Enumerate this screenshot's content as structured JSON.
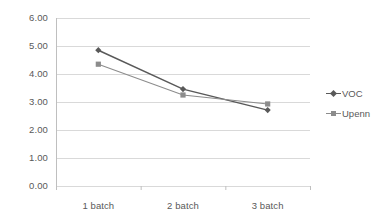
{
  "chart_data": {
    "type": "line",
    "title": "",
    "xlabel": "",
    "ylabel": "",
    "categories": [
      "1 batch",
      "2 batch",
      "3 batch"
    ],
    "ylim": [
      0.0,
      6.0
    ],
    "y_ticks": [
      0.0,
      1.0,
      2.0,
      3.0,
      4.0,
      5.0,
      6.0
    ],
    "y_tick_labels": [
      "0.00",
      "1.00",
      "2.00",
      "3.00",
      "4.00",
      "5.00",
      "6.00"
    ],
    "grid": true,
    "grid_axis": "y",
    "legend_position": "right",
    "series": [
      {
        "name": "VOC",
        "values": [
          4.85,
          3.46,
          2.71
        ],
        "marker": "diamond",
        "color": "#595959"
      },
      {
        "name": "Upenn",
        "values": [
          4.35,
          3.25,
          2.93
        ],
        "marker": "square",
        "color": "#8c8c8c"
      }
    ]
  },
  "legend": {
    "items": [
      {
        "label": "VOC",
        "marker_icon": "diamond-marker-icon"
      },
      {
        "label": "Upenn",
        "marker_icon": "square-marker-icon"
      }
    ]
  },
  "axes": {
    "y_labels": [
      "6.00",
      "5.00",
      "4.00",
      "3.00",
      "2.00",
      "1.00",
      "0.00"
    ],
    "x_labels": [
      "1 batch",
      "2 batch",
      "3 batch"
    ]
  },
  "colors": {
    "series_voc": "#595959",
    "series_upenn": "#8c8c8c",
    "grid": "#d9d9d9",
    "axis": "#bfbfbf",
    "text": "#595959",
    "background": "#ffffff"
  }
}
